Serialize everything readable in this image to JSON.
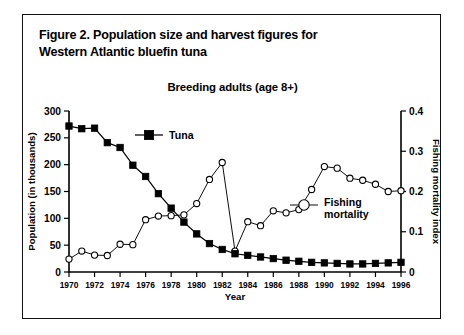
{
  "figure": {
    "caption_line1": "Figure 2. Population size and harvest figures for",
    "caption_line2": "Western Atlantic bluefin tuna"
  },
  "chart_data": {
    "type": "line",
    "title": "Breeding adults (age 8+)",
    "xlabel": "Year",
    "ylabel": "Population (in thousands)",
    "y2label": "Fishing mortality index",
    "xlim": [
      1970,
      1996
    ],
    "ylim": [
      0,
      300
    ],
    "y2lim": [
      0,
      0.4
    ],
    "yticks": [
      "0",
      "50",
      "100",
      "150",
      "200",
      "250",
      "300"
    ],
    "y2ticks": [
      "0",
      "0.1",
      "0.2",
      "0.3",
      "0.4"
    ],
    "xticks": [
      "1970",
      "1972",
      "1974",
      "1976",
      "1978",
      "1980",
      "1982",
      "1984",
      "1986",
      "1988",
      "1990",
      "1992",
      "1994",
      "1996"
    ],
    "grid": false,
    "legend_position": "inside",
    "x": [
      1970,
      1971,
      1972,
      1973,
      1974,
      1975,
      1976,
      1977,
      1978,
      1979,
      1980,
      1981,
      1982,
      1983,
      1984,
      1985,
      1986,
      1987,
      1988,
      1989,
      1990,
      1991,
      1992,
      1993,
      1994,
      1995,
      1996
    ],
    "series": [
      {
        "name": "Tuna",
        "axis": "left",
        "marker": "filled-square",
        "values": [
          272,
          267,
          268,
          241,
          232,
          199,
          178,
          146,
          119,
          93,
          71,
          53,
          42,
          34,
          31,
          28,
          25,
          22,
          20,
          18,
          17,
          16,
          15,
          15,
          16,
          17,
          18
        ]
      },
      {
        "name": "Fishing mortality",
        "axis": "right",
        "marker": "open-circle",
        "values": [
          0.032,
          0.052,
          0.042,
          0.041,
          0.069,
          0.068,
          0.13,
          0.139,
          0.14,
          0.142,
          0.17,
          0.23,
          0.272,
          0.052,
          0.125,
          0.115,
          0.152,
          0.147,
          0.155,
          0.205,
          0.262,
          0.258,
          0.233,
          0.228,
          0.218,
          0.2,
          0.202
        ]
      }
    ]
  }
}
